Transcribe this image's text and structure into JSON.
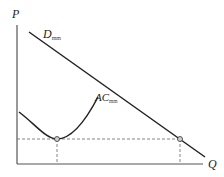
{
  "diagram": {
    "axes": {
      "y_label": "P",
      "x_label": "Q"
    },
    "curves": [
      {
        "id": "demand",
        "label": "D",
        "subscript": "mm",
        "type": "line"
      },
      {
        "id": "average-cost",
        "label": "AC",
        "subscript": "mm",
        "type": "u-curve"
      }
    ],
    "points": [
      {
        "id": "ac-minimum",
        "description": "minimum point of AC curve"
      },
      {
        "id": "demand-intersection",
        "description": "demand line at min-AC price level"
      }
    ],
    "guides": [
      {
        "id": "price-level-dashed",
        "orientation": "horizontal"
      },
      {
        "id": "min-ac-quantity-dashed",
        "orientation": "vertical"
      },
      {
        "id": "demand-quantity-dashed",
        "orientation": "vertical"
      }
    ],
    "colors": {
      "line": "#222222",
      "axis": "#555555",
      "dashed": "#666666",
      "point_fill": "#cfcfcf"
    }
  }
}
